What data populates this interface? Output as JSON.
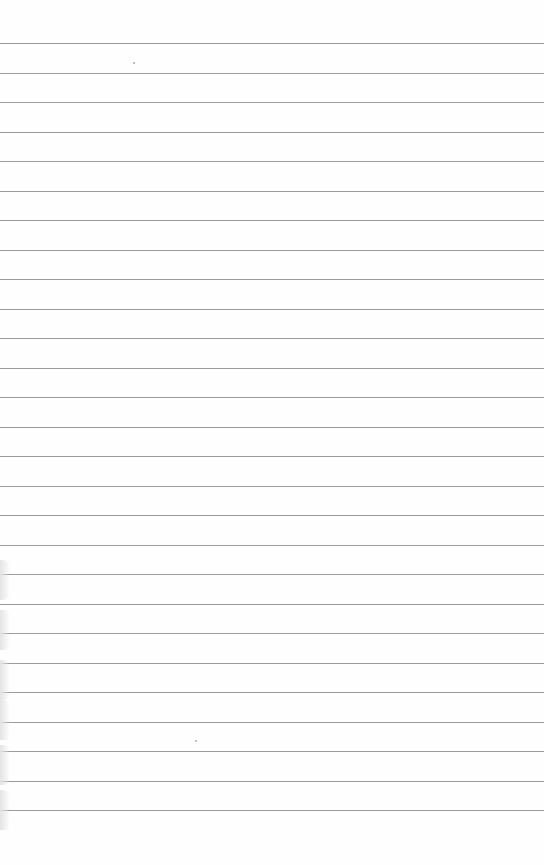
{
  "page": {
    "type": "lined-paper",
    "line_count": 27,
    "first_line_y": 43,
    "line_spacing": 29.5,
    "line_color": "#8a8a8a",
    "background_color": "#fefefe"
  }
}
